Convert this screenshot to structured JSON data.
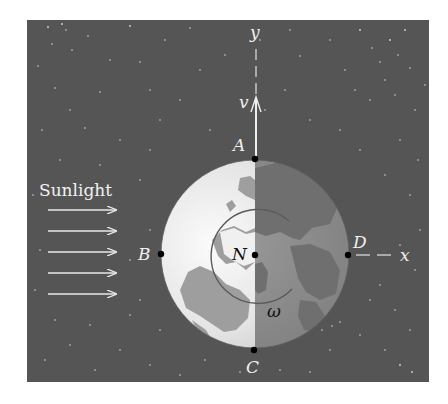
{
  "figure": {
    "sunlight_label": "Sunlight",
    "axes": {
      "y_label": "y",
      "x_label": "x"
    },
    "velocity_label": "v",
    "points": [
      {
        "id": "A",
        "label": "A",
        "position": "top"
      },
      {
        "id": "B",
        "label": "B",
        "position": "left"
      },
      {
        "id": "C",
        "label": "C",
        "position": "bottom"
      },
      {
        "id": "D",
        "label": "D",
        "position": "right"
      },
      {
        "id": "N",
        "label": "N",
        "position": "center"
      }
    ],
    "angular_velocity_label": "ω",
    "sunlight_arrow_count": 5,
    "colors": {
      "space": "#555555",
      "star": "#d8d8d8",
      "globe_lit": "#e6e6e6",
      "globe_dark": "#8a8a8a",
      "land_lit": "#9a9a9a",
      "land_dark": "#6e6e6e",
      "label_light": "#f2f2f2",
      "label_dark": "#111111"
    }
  }
}
